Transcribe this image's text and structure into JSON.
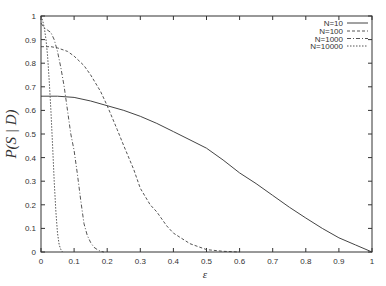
{
  "chart_data": {
    "type": "line",
    "title": "",
    "xlabel": "ε",
    "ylabel": "P(S | D)",
    "xlim": [
      0,
      1
    ],
    "ylim": [
      0,
      1
    ],
    "grid": false,
    "legend_position": "top-right",
    "x_ticks": [
      "0",
      "0.1",
      "0.2",
      "0.3",
      "0.4",
      "0.5",
      "0.6",
      "0.7",
      "0.8",
      "0.9",
      "1"
    ],
    "y_ticks": [
      "0",
      "0.1",
      "0.2",
      "0.3",
      "0.4",
      "0.5",
      "0.6",
      "0.7",
      "0.8",
      "0.9",
      "1"
    ],
    "series": [
      {
        "name": "N=10",
        "style": "solid",
        "x": [
          0,
          0.05,
          0.1,
          0.15,
          0.2,
          0.25,
          0.3,
          0.35,
          0.4,
          0.45,
          0.5,
          0.55,
          0.6,
          0.65,
          0.7,
          0.75,
          0.8,
          0.85,
          0.9,
          0.95,
          1.0
        ],
        "y": [
          0.66,
          0.66,
          0.655,
          0.64,
          0.62,
          0.6,
          0.575,
          0.545,
          0.51,
          0.475,
          0.44,
          0.39,
          0.335,
          0.29,
          0.24,
          0.19,
          0.144,
          0.1,
          0.06,
          0.03,
          0.0
        ]
      },
      {
        "name": "N=100",
        "style": "dashed",
        "x": [
          0,
          0.03,
          0.05,
          0.08,
          0.1,
          0.13,
          0.15,
          0.18,
          0.2,
          0.23,
          0.25,
          0.28,
          0.3,
          0.33,
          0.35,
          0.38,
          0.4,
          0.45,
          0.5,
          0.55,
          0.6
        ],
        "y": [
          0.87,
          0.87,
          0.865,
          0.85,
          0.83,
          0.79,
          0.75,
          0.68,
          0.62,
          0.52,
          0.45,
          0.35,
          0.27,
          0.2,
          0.17,
          0.11,
          0.08,
          0.035,
          0.01,
          0.003,
          0.0
        ]
      },
      {
        "name": "N=1000",
        "style": "dash-dot",
        "x": [
          0,
          0.01,
          0.02,
          0.03,
          0.04,
          0.05,
          0.06,
          0.07,
          0.08,
          0.09,
          0.1,
          0.11,
          0.12,
          0.13,
          0.14,
          0.15,
          0.16,
          0.17,
          0.18,
          0.19
        ],
        "y": [
          0.97,
          0.95,
          0.94,
          0.93,
          0.9,
          0.85,
          0.78,
          0.7,
          0.6,
          0.5,
          0.43,
          0.33,
          0.22,
          0.12,
          0.07,
          0.04,
          0.02,
          0.01,
          0.003,
          0.0
        ]
      },
      {
        "name": "N=10000",
        "style": "dotted",
        "x": [
          0,
          0.005,
          0.01,
          0.015,
          0.02,
          0.025,
          0.03,
          0.035,
          0.04,
          0.045,
          0.05,
          0.055,
          0.06,
          0.065
        ],
        "y": [
          1.0,
          0.98,
          0.95,
          0.9,
          0.83,
          0.72,
          0.6,
          0.45,
          0.3,
          0.17,
          0.08,
          0.03,
          0.01,
          0.0
        ]
      }
    ]
  },
  "colors": {
    "axis": "#333333",
    "series": [
      "#444444",
      "#555555",
      "#555555",
      "#555555"
    ]
  }
}
